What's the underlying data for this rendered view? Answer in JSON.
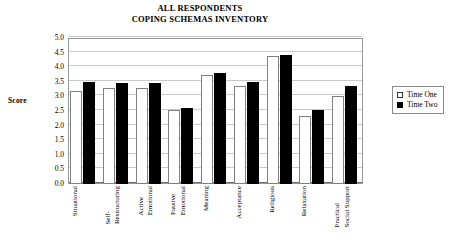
{
  "chart_data": {
    "type": "bar",
    "title": "ALL RESPONDENTS COPING SCHEMAS INVENTORY",
    "title_lines": [
      "ALL RESPONDENTS",
      "COPING SCHEMAS INVENTORY"
    ],
    "xlabel": "",
    "ylabel": "Score",
    "ylim": [
      0.0,
      5.0
    ],
    "ytick_step": 0.5,
    "grid": true,
    "legend_position": "right",
    "categories": [
      "Situational",
      "Self-Restructuring",
      "Active Emotional",
      "Passive Emotional",
      "Meaning",
      "Acceptance",
      "Religious",
      "Relaxation",
      "Practical Social Support"
    ],
    "category_lines": [
      [
        "Situational"
      ],
      [
        "Self-",
        "Restructuring"
      ],
      [
        "Active",
        "Emotional"
      ],
      [
        "Passive",
        "Emotional"
      ],
      [
        "Meaning"
      ],
      [
        "Acceptance"
      ],
      [
        "Religious"
      ],
      [
        "Relaxation"
      ],
      [
        "Practical",
        "Social Support"
      ]
    ],
    "yticks": [
      "0.0",
      "0.5",
      "1.0",
      "1.5",
      "2.0",
      "2.5",
      "3.0",
      "3.5",
      "4.0",
      "4.5",
      "5.0"
    ],
    "series": [
      {
        "name": "Time One",
        "color": "#ffffff",
        "values": [
          3.2,
          3.28,
          3.3,
          2.55,
          3.73,
          3.35,
          4.4,
          2.33,
          3.0
        ]
      },
      {
        "name": "Time Two",
        "color": "#000000",
        "values": [
          3.51,
          3.45,
          3.45,
          2.61,
          3.8,
          3.48,
          4.43,
          2.55,
          3.34
        ]
      }
    ]
  },
  "legend": {
    "items": [
      {
        "label": "Time One",
        "swatch": "open-square-icon"
      },
      {
        "label": "Time Two",
        "swatch": "filled-square-icon"
      }
    ]
  }
}
